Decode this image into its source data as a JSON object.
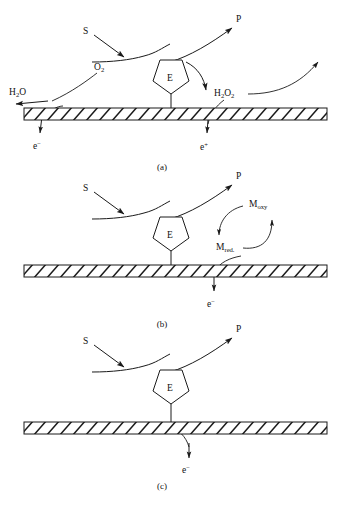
{
  "figure": {
    "type": "diagram",
    "background_color": "#ffffff",
    "line_color": "#1a1a1a"
  },
  "panels": [
    {
      "id": "a",
      "caption": "(a)",
      "enzyme_label": "E",
      "labels": {
        "substrate": "S",
        "product": "P",
        "oxygen": "O",
        "oxygen_sub": "2",
        "water": "H",
        "water_sub1": "2",
        "water_rest": "O",
        "peroxide": "H",
        "peroxide_sub1": "2",
        "peroxide_mid": "O",
        "peroxide_sub2": "2",
        "electron": "e",
        "electron_sup": "−",
        "positive": "e",
        "positive_sup": "+"
      }
    },
    {
      "id": "b",
      "caption": "(b)",
      "enzyme_label": "E",
      "labels": {
        "substrate": "S",
        "product": "P",
        "mediator_ox": "M",
        "mediator_ox_sub": "oxy",
        "mediator_red": "M",
        "mediator_red_sub": "red.",
        "electron": "e",
        "electron_sup": "−"
      }
    },
    {
      "id": "c",
      "caption": "(c)",
      "enzyme_label": "E",
      "labels": {
        "substrate": "S",
        "product": "P",
        "electron": "e",
        "electron_sup": "−"
      }
    }
  ]
}
